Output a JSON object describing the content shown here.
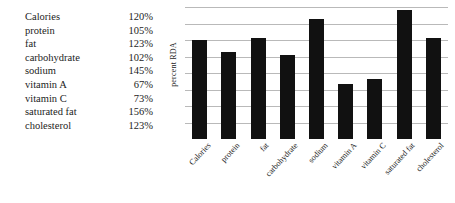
{
  "table": {
    "rows": [
      {
        "name": "Calories",
        "percent": "120%"
      },
      {
        "name": "protein",
        "percent": "105%"
      },
      {
        "name": "fat",
        "percent": "123%"
      },
      {
        "name": "carbohydrate",
        "percent": "102%"
      },
      {
        "name": "sodium",
        "percent": "145%"
      },
      {
        "name": "vitamin A",
        "percent": "67%"
      },
      {
        "name": "vitamin C",
        "percent": "73%"
      },
      {
        "name": "saturated fat",
        "percent": "156%"
      },
      {
        "name": "cholesterol",
        "percent": "123%"
      }
    ]
  },
  "chart_data": {
    "type": "bar",
    "title": "",
    "xlabel": "",
    "ylabel": "percent RDA",
    "categories": [
      "Calories",
      "protein",
      "fat",
      "carbohydrate",
      "sodium",
      "vitamin A",
      "vitamin C",
      "saturated fat",
      "cholesterol"
    ],
    "values": [
      120,
      105,
      123,
      102,
      145,
      67,
      73,
      156,
      123
    ],
    "ylim": [
      0,
      160
    ],
    "ytick_values": [
      20,
      40,
      60,
      80,
      100,
      120,
      140,
      160
    ],
    "ytick_labels": [],
    "grid": true,
    "legend": false,
    "bar_color": "#111111",
    "gridline_color": "#b9b9b9",
    "xtick_rotation": -47
  }
}
